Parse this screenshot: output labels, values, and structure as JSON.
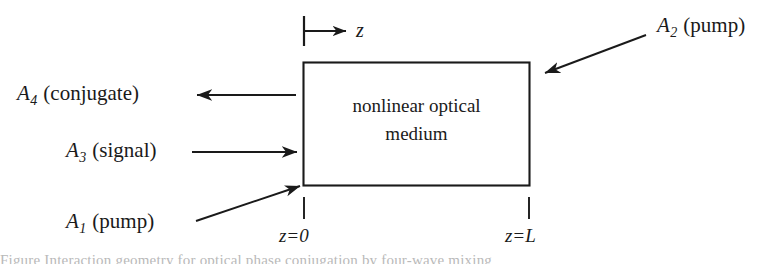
{
  "figure": {
    "type": "optical-phase-conjugation-four-wave-mixing-diagram",
    "background_color": "#ffffff",
    "line_color": "#1a1a1a",
    "medium": {
      "line1": "nonlinear optical",
      "line2": "medium"
    },
    "axis": {
      "label": "z",
      "direction": "right"
    },
    "coordinates": {
      "left": {
        "var": "z",
        "op": "=",
        "value": "0",
        "full": "z = 0"
      },
      "right": {
        "var": "z",
        "op": "=",
        "value": "L",
        "full": "z = L"
      }
    },
    "beams": [
      {
        "id": "A4",
        "symbol": "A",
        "subscript": "4",
        "role": "(conjugate)",
        "full": "A4 (conjugate)",
        "arrow": "left",
        "description": "conjugate wave leaving medium to the left"
      },
      {
        "id": "A3",
        "symbol": "A",
        "subscript": "3",
        "role": "(signal)",
        "full": "A3 (signal)",
        "arrow": "right",
        "description": "signal wave entering medium from the left"
      },
      {
        "id": "A1",
        "symbol": "A",
        "subscript": "1",
        "role": "(pump)",
        "full": "A1 (pump)",
        "arrow": "diagonal-up-right",
        "description": "forward pump wave entering lower-left of medium"
      },
      {
        "id": "A2",
        "symbol": "A",
        "subscript": "2",
        "role": "(pump)",
        "full": "A2 (pump)",
        "arrow": "diagonal-down-left",
        "description": "backward pump wave entering upper-right of medium"
      }
    ],
    "caption_sliver": "Figure  Interaction geometry for optical phase conjugation by four-wave mixing"
  }
}
